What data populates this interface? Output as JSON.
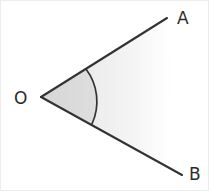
{
  "figure": {
    "type": "geometry-diagram",
    "width": 209,
    "height": 191,
    "background_color": "#ffffff",
    "border_color": "#e6e6e6",
    "line_color": "#333333",
    "arc_color": "#333333",
    "sector_fill_color": "#d9d9d9",
    "wedge_fill_color": "#ededed",
    "label_color": "#2b2b2b"
  },
  "labels": {
    "vertex": "O",
    "ray_top": "A",
    "ray_bottom": "B"
  },
  "geometry": {
    "vertex_point": {
      "x": 41,
      "y": 97
    },
    "ray_top_end": {
      "x": 167,
      "y": 18
    },
    "ray_bottom_end": {
      "x": 182,
      "y": 175
    },
    "arc_start": {
      "x": 86,
      "y": 69
    },
    "arc_end": {
      "x": 92,
      "y": 124
    },
    "arc_radius": 54,
    "label_positions": {
      "vertex": {
        "x": 14,
        "y": 104
      },
      "ray_top": {
        "x": 177,
        "y": 24
      },
      "ray_bottom": {
        "x": 189,
        "y": 180
      }
    }
  }
}
